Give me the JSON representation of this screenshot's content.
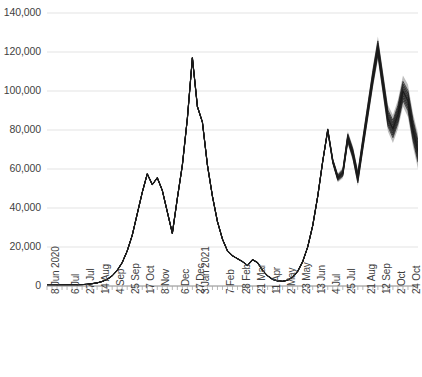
{
  "chart_data": {
    "type": "line",
    "title": "",
    "subtitle": "",
    "xlabel": "",
    "ylabel": "",
    "ylim": [
      0,
      140000
    ],
    "grid": true,
    "legend": false,
    "legend_position": "none",
    "y_ticks": [
      0,
      20000,
      40000,
      60000,
      80000,
      100000,
      120000,
      140000
    ],
    "y_tick_labels": [
      "0",
      "20,000",
      "40,000",
      "60,000",
      "80,000",
      "100,000",
      "120,000",
      "140,000"
    ],
    "x_tick_labels": [
      "8 Jun 2020",
      "6 Jul",
      "27 Jul",
      "14 Aug",
      "4 Sep",
      "25 Sep",
      "17 Oct",
      "8 Nov",
      "6 Dec",
      "27 Dec",
      "3 Jan 2021",
      "7 Feb",
      "28 Feb",
      "21 Mar",
      "11 Apr",
      "2 May",
      "23 May",
      "13 Jun",
      "4 Jul",
      "25 Jul",
      "21 Aug",
      "12 Sep",
      "2 Oct",
      "24 Oct"
    ],
    "x_label_tick_indices": [
      0,
      4,
      7,
      10,
      13,
      16,
      19,
      22,
      26,
      29,
      30,
      35,
      38,
      41,
      44,
      47,
      50,
      53,
      56,
      59,
      63,
      66,
      69,
      72
    ],
    "n_points": 75,
    "series": [
      {
        "name": "Observed and projected",
        "color": "#1a1a1a",
        "values": [
          400,
          420,
          450,
          470,
          500,
          540,
          600,
          700,
          900,
          1200,
          1600,
          2300,
          3400,
          5200,
          8000,
          12000,
          18000,
          26000,
          37000,
          48000,
          57500,
          52000,
          55500,
          49000,
          38000,
          27000,
          45000,
          62000,
          86000,
          117000,
          92000,
          84000,
          62000,
          46000,
          33000,
          24000,
          18000,
          15500,
          14000,
          12500,
          10500,
          13500,
          12000,
          8000,
          5200,
          3400,
          2600,
          2400,
          3000,
          4600,
          7500,
          12500,
          20000,
          31000,
          46000,
          64000,
          80000,
          64000,
          55500,
          58000,
          76000,
          68000,
          55500,
          73000,
          90000,
          107000,
          122000,
          104000,
          86000,
          80500,
          88000,
          100000,
          95000,
          80000,
          69000
        ]
      }
    ],
    "uncertainty_band": {
      "description": "Grey forecast fan around the projection from mid-2021 onward",
      "start_index": 55,
      "outer_color": "#bdbdbd",
      "inner_color": "#6e6e6e",
      "max_spread": 9000
    },
    "axis_color": "#a6a6a6",
    "gridline_color": "#e3e3e3",
    "background_color": "#ffffff"
  },
  "axes": {
    "y_axis_name": "value-axis",
    "x_axis_name": "date-axis"
  }
}
